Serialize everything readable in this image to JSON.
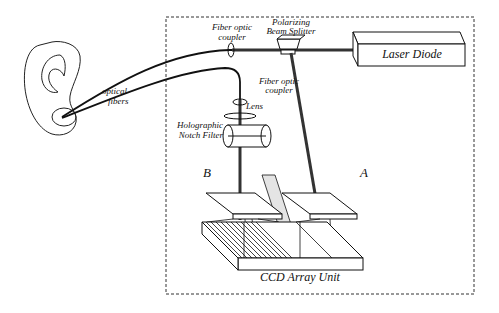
{
  "diagram": {
    "labels": {
      "optical_fibers_1": "optical",
      "optical_fibers_2": "fibers",
      "fiber_coupler_top_1": "Fiber optic",
      "fiber_coupler_top_2": "coupler",
      "beam_splitter_1": "Polarizing",
      "beam_splitter_2": "Beam Splitter",
      "laser_diode": "Laser Diode",
      "fiber_coupler_mid_1": "Fiber optic",
      "fiber_coupler_mid_2": "coupler",
      "lens": "Lens",
      "notch_filter_1": "Holographic",
      "notch_filter_2": "Notch Filter",
      "grating_b": "B",
      "grating_a": "A",
      "ccd": "CCD Array Unit"
    },
    "colors": {
      "line": "#111111",
      "shade": "#e4e4e4",
      "background": "#ffffff"
    }
  }
}
